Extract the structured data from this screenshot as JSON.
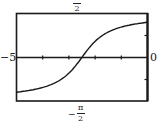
{
  "chart_data": {
    "type": "line",
    "title": "",
    "xlabel": "",
    "ylabel": "",
    "xlim": [
      -5,
      0
    ],
    "ylim": [
      -1.5708,
      1.5708
    ],
    "x_tick_labels": {
      "left": "−5",
      "right": "0"
    },
    "y_tick_labels": {
      "top": "π/2",
      "bottom": "−π/2"
    },
    "grid": false,
    "legend": null,
    "series": [
      {
        "name": "arctan curve",
        "function": "y = arctan(x + 2.5) style S-curve",
        "x": [
          -5,
          -4.5,
          -4,
          -3.5,
          -3,
          -2.75,
          -2.5,
          -2.25,
          -2,
          -1.5,
          -1,
          -0.5,
          0
        ],
        "y": [
          -1.19,
          -1.11,
          -0.98,
          -0.79,
          -0.46,
          -0.24,
          0.0,
          0.24,
          0.46,
          0.79,
          0.98,
          1.11,
          1.19
        ]
      }
    ],
    "x_ticks": [
      -4,
      -3,
      -2,
      -1
    ],
    "y_ticks": [
      -0.785,
      0.785
    ]
  },
  "labels": {
    "left": "−5",
    "right": "0",
    "top_num": "π",
    "top_den": "2",
    "bottom_num": "−π",
    "bottom_sign": "−",
    "bottom_pi": "π",
    "bottom_den": "2"
  }
}
